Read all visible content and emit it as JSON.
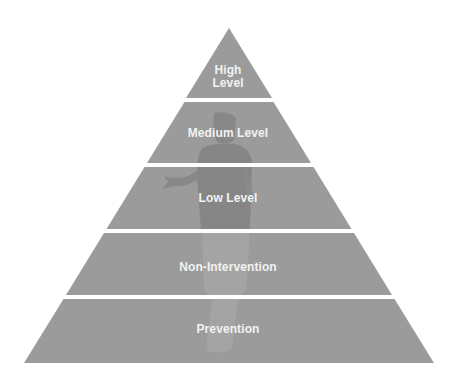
{
  "diagram": {
    "type": "pyramid",
    "colors": {
      "band": "#9b9b9b",
      "silhouette": "#858585",
      "silhouette_light": "#a8a8a8",
      "text": "#f2f2f2",
      "background": "#ffffff"
    },
    "levels": [
      {
        "label_line1": "High",
        "label_line2": "Level"
      },
      {
        "label": "Medium Level"
      },
      {
        "label": "Low Level"
      },
      {
        "label": "Non-Intervention"
      },
      {
        "label": "Prevention"
      }
    ]
  }
}
